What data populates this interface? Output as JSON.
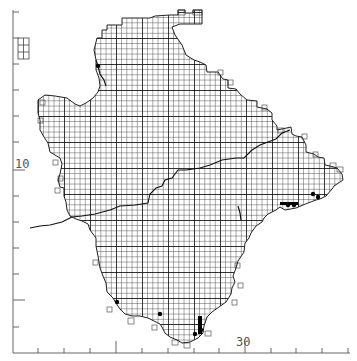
{
  "map": {
    "type": "grid-distribution-map",
    "grid_cell_px": 5.2,
    "major_grid_px": 26,
    "colors": {
      "background": "#ffffff",
      "grid_minor": "#333333",
      "grid_major": "#111111",
      "outline": "#222222",
      "axis": "#555555",
      "record": "#000000"
    }
  },
  "axes": {
    "x_label": "30",
    "y_label": "10",
    "x_ticks_px": [
      38,
      64,
      90,
      116,
      142,
      168,
      194,
      219,
      245,
      271,
      296,
      322,
      348
    ],
    "x_long_ticks_px": [
      116,
      245
    ],
    "y_ticks_px": [
      12,
      38,
      64,
      90,
      116,
      142,
      170,
      196,
      222,
      248,
      274,
      300,
      327
    ],
    "y_long_ticks_px": [
      170,
      300
    ]
  },
  "legend": {
    "north_arrow_label": "N"
  },
  "records": [
    {
      "x": 98,
      "y": 66
    },
    {
      "x": 117,
      "y": 302
    },
    {
      "x": 160,
      "y": 314
    },
    {
      "x": 200,
      "y": 319
    },
    {
      "x": 200,
      "y": 325
    },
    {
      "x": 201,
      "y": 330
    },
    {
      "x": 195,
      "y": 334
    },
    {
      "x": 288,
      "y": 205
    },
    {
      "x": 294,
      "y": 205
    },
    {
      "x": 313,
      "y": 194
    },
    {
      "x": 318,
      "y": 197
    }
  ]
}
